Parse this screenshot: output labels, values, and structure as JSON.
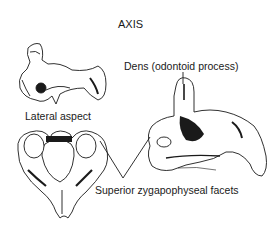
{
  "figure": {
    "title": "AXIS",
    "labels": {
      "dens": "Dens (odontoid process)",
      "lateral_aspect": "Lateral aspect",
      "superior_facets": "Superior zygapophyseal facets"
    },
    "views": [
      {
        "name": "lateral-view",
        "description": "Axis vertebra, lateral aspect"
      },
      {
        "name": "superior-view",
        "description": "Axis vertebra, superior view"
      },
      {
        "name": "oblique-view",
        "description": "Axis vertebra, posterolateral oblique view showing dens"
      }
    ],
    "colors": {
      "ink": "#1a1a1a",
      "background": "#ffffff"
    }
  }
}
